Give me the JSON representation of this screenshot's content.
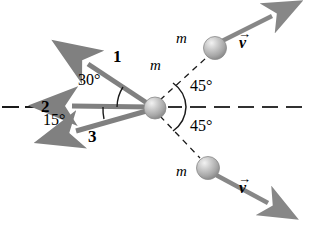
{
  "figure": {
    "type": "physics-vector-diagram",
    "colors": {
      "vector_gray": "#808080",
      "vector_gray_dark": "#6e6e6e",
      "sphere_fill": "#b5b5b5",
      "sphere_highlight": "#e8e8e8",
      "sphere_edge": "#8a8a8a",
      "axis_black": "#1a1a1a",
      "text_black": "#000000"
    },
    "center_mass_label": "m",
    "incoming_vectors": [
      {
        "id": "1",
        "label": "1",
        "angle_deg": 30,
        "direction": "up-left",
        "label_x": 113,
        "label_y": 48
      },
      {
        "id": "2",
        "label": "2",
        "angle_deg": 0,
        "direction": "left",
        "label_x": 41,
        "label_y": 98
      },
      {
        "id": "3",
        "label": "3",
        "angle_deg": -15,
        "direction": "down-left",
        "label_x": 88,
        "label_y": 128
      }
    ],
    "angle_labels": [
      {
        "id": "angle-30",
        "text": "30°",
        "x": 78,
        "y": 72
      },
      {
        "id": "angle-15",
        "text": "15°",
        "x": 43,
        "y": 112
      },
      {
        "id": "angle-45-upper",
        "text": "45°",
        "x": 190,
        "y": 78
      },
      {
        "id": "angle-45-lower",
        "text": "45°",
        "x": 190,
        "y": 118
      }
    ],
    "outgoing_masses": [
      {
        "id": "upper",
        "mass_label": "m",
        "velocity_label": "v",
        "angle_deg": 45,
        "mass_label_x": 176,
        "mass_label_y": 31,
        "velocity_label_x": 239,
        "velocity_label_y": 35
      },
      {
        "id": "lower",
        "mass_label": "m",
        "velocity_label": "v",
        "angle_deg": -45,
        "mass_label_x": 176,
        "mass_label_y": 164,
        "velocity_label_x": 239,
        "velocity_label_y": 164
      }
    ],
    "center_mass_label_x": 150,
    "center_mass_label_y": 58,
    "axis": {
      "style": "dashed",
      "orientation": "horizontal",
      "y": 107
    }
  }
}
